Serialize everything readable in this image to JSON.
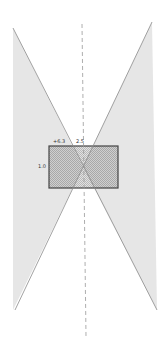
{
  "diagram": {
    "labels": {
      "top_left": "+6.3",
      "top_right": "2.5",
      "left": "1.0"
    },
    "colors": {
      "cone_fill": "#e4e4e4",
      "cone_edge": "#8a8a8a",
      "rect_fill": "#d0d0d0",
      "rect_stroke": "#444444",
      "axis": "#999999"
    }
  }
}
